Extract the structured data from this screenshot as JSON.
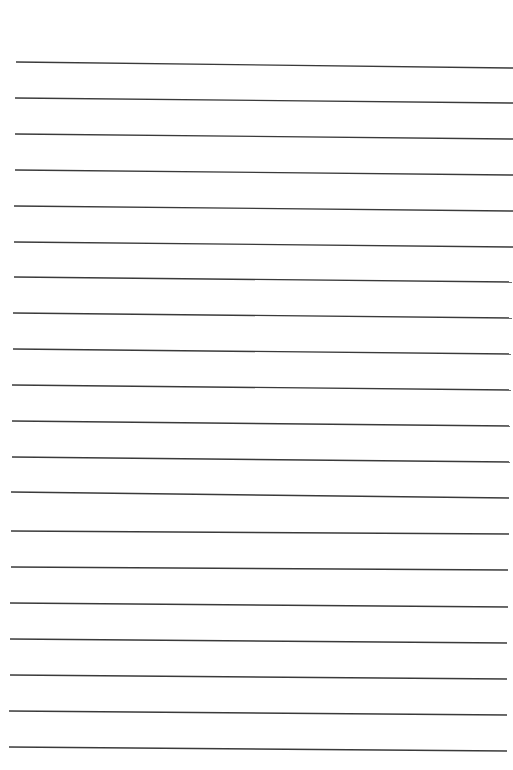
{
  "page": {
    "type": "lined-paper",
    "background_color": "#ffffff",
    "line_color": "#3a3a3a",
    "line_count": 20,
    "line_spacing_px": 36
  },
  "lines": [
    {
      "x1": 16,
      "y1": 62,
      "x2": 513,
      "y2": 68
    },
    {
      "x1": 15,
      "y1": 98,
      "x2": 513,
      "y2": 103
    },
    {
      "x1": 15,
      "y1": 134,
      "x2": 513,
      "y2": 139
    },
    {
      "x1": 15,
      "y1": 170,
      "x2": 513,
      "y2": 175
    },
    {
      "x1": 14,
      "y1": 206,
      "x2": 513,
      "y2": 211
    },
    {
      "x1": 14,
      "y1": 242,
      "x2": 513,
      "y2": 247
    },
    {
      "x1": 14,
      "y1": 277,
      "x2": 512,
      "y2": 282
    },
    {
      "x1": 13,
      "y1": 313,
      "x2": 512,
      "y2": 318
    },
    {
      "x1": 13,
      "y1": 349,
      "x2": 511,
      "y2": 354
    },
    {
      "x1": 12,
      "y1": 385,
      "x2": 511,
      "y2": 390
    },
    {
      "x1": 12,
      "y1": 421,
      "x2": 510,
      "y2": 426
    },
    {
      "x1": 12,
      "y1": 457,
      "x2": 510,
      "y2": 462
    },
    {
      "x1": 11,
      "y1": 492,
      "x2": 509,
      "y2": 498
    },
    {
      "x1": 11,
      "y1": 531,
      "x2": 509,
      "y2": 534
    },
    {
      "x1": 11,
      "y1": 567,
      "x2": 508,
      "y2": 570
    },
    {
      "x1": 10,
      "y1": 603,
      "x2": 508,
      "y2": 607
    },
    {
      "x1": 10,
      "y1": 639,
      "x2": 507,
      "y2": 643
    },
    {
      "x1": 10,
      "y1": 675,
      "x2": 507,
      "y2": 679
    },
    {
      "x1": 9,
      "y1": 711,
      "x2": 507,
      "y2": 715
    },
    {
      "x1": 9,
      "y1": 747,
      "x2": 507,
      "y2": 751
    }
  ]
}
